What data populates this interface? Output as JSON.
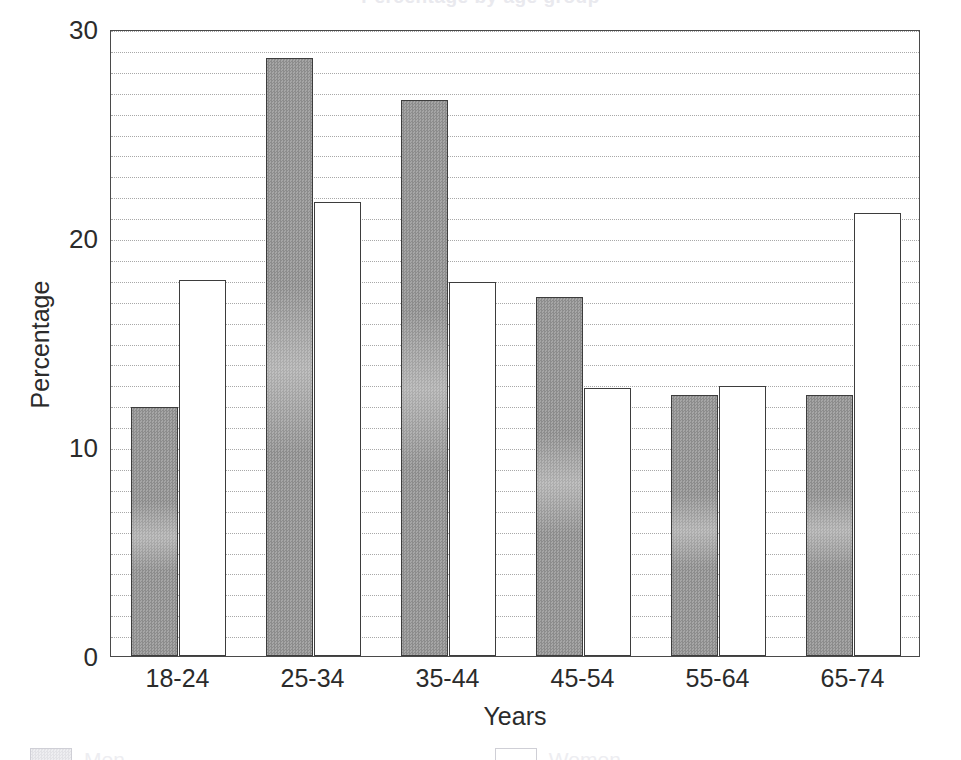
{
  "chart_data": {
    "type": "bar",
    "title": "Percentage by age group",
    "xlabel": "Years",
    "ylabel": "Percentage",
    "categories": [
      "18-24",
      "25-34",
      "35-44",
      "45-54",
      "55-64",
      "65-74"
    ],
    "series": [
      {
        "name": "Men",
        "fill": "gray-hatched",
        "color": "#9a9a9a",
        "values": [
          11.9,
          28.6,
          26.6,
          17.2,
          12.5,
          12.5
        ]
      },
      {
        "name": "Women",
        "fill": "white",
        "color": "#ffffff",
        "values": [
          18.0,
          21.7,
          17.9,
          12.8,
          12.9,
          21.2
        ]
      }
    ],
    "ylim": [
      0,
      30
    ],
    "yticks": [
      0,
      10,
      20,
      30
    ],
    "ytick_labels": [
      "0",
      "10",
      "20",
      "30"
    ],
    "minor_gridline_step": 1,
    "grid": true,
    "grid_style": "dotted",
    "legend_position": "bottom-outside",
    "frame": true
  },
  "axes": {
    "y_title": "Percentage",
    "x_title": "Years"
  },
  "legend": {
    "items": [
      {
        "label": "Men",
        "swatch": "gray-hatched"
      },
      {
        "label": "Women",
        "swatch": "white"
      }
    ]
  },
  "colors": {
    "bar_gray": "#9a9a9a",
    "bar_white": "#ffffff",
    "bar_edge": "#3d3d3d",
    "frame": "#4a4a4a",
    "grid": "#9a9a9a",
    "text": "#2b2b2b"
  }
}
